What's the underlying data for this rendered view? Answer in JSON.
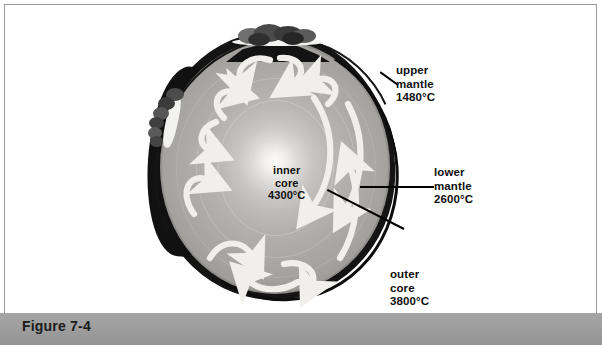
{
  "figure": {
    "caption": "Figure 7-4"
  },
  "labels": {
    "inner_core": "inner\ncore\n4300°C",
    "inner_core_name": "inner core",
    "inner_core_temp": "4300°C",
    "upper_mantle": "upper\nmantle\n1480°C",
    "upper_mantle_name": "upper mantle",
    "upper_mantle_temp": "1480°C",
    "lower_mantle": "lower\nmantle\n2600°C",
    "lower_mantle_name": "lower mantle",
    "lower_mantle_temp": "2600°C",
    "outer_core": "outer\ncore\n3800°C",
    "outer_core_name": "outer core",
    "outer_core_temp": "3800°C"
  },
  "icons": {
    "volcano_top": "volcano-eruption-icon",
    "volcano_left": "volcano-eruption-icon",
    "convection": "convection-arrow-icon"
  },
  "colors": {
    "frame_border": "#9a9a9a",
    "page_background": "#ffffff",
    "caption_bar": "#9c9c9c",
    "caption_text": "#1b1b1b",
    "crust": "#141414",
    "mantle_outer": "#8b8a88",
    "mantle_mid": "#acaaa6",
    "core_bright": "#fcfcfa",
    "arrow": "#f0efec",
    "label_text": "#101010",
    "leader_line": "#000000"
  }
}
